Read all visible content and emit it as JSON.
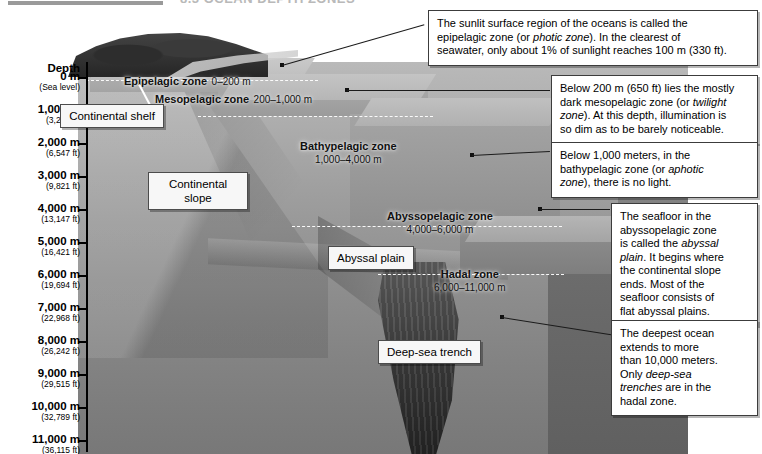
{
  "header": {
    "title": "8.3  OCEAN DEPTH ZONES"
  },
  "axis": {
    "title": "Depth",
    "ticks": [
      {
        "meters": "0 m",
        "feet": "(Sea level)"
      },
      {
        "meters": "1,000 m",
        "feet": "(3,274 ft)"
      },
      {
        "meters": "2,000 m",
        "feet": "(6,547 ft)"
      },
      {
        "meters": "3,000 m",
        "feet": "(9,821 ft)"
      },
      {
        "meters": "4,000 m",
        "feet": "(13,147 ft)"
      },
      {
        "meters": "5,000 m",
        "feet": "(16,421 ft)"
      },
      {
        "meters": "6,000 m",
        "feet": "(19,694 ft)"
      },
      {
        "meters": "7,000 m",
        "feet": "(22,968 ft)"
      },
      {
        "meters": "8,000 m",
        "feet": "(26,242 ft)"
      },
      {
        "meters": "9,000 m",
        "feet": "(29,515 ft)"
      },
      {
        "meters": "10,000 m",
        "feet": "(32,789 ft)"
      },
      {
        "meters": "11,000 m",
        "feet": "(36,115 ft)"
      }
    ]
  },
  "zones": [
    {
      "name": "Epipelagic zone",
      "range": "0–200 m"
    },
    {
      "name": "Mesopelagic zone",
      "range": "200–1,000 m"
    },
    {
      "name": "Bathypelagic zone",
      "range": "1,000–4,000 m"
    },
    {
      "name": "Abyssopelagic zone",
      "range": "4,000–6,000 m"
    },
    {
      "name": "Hadal zone",
      "range": "6,000–11,000 m"
    }
  ],
  "feature_labels": {
    "continental_shelf": "Continental shelf",
    "continental_slope": "Continental slope",
    "abyssal_plain": "Abyssal plain",
    "deep_sea_trench": "Deep-sea trench"
  },
  "notes": {
    "epipelagic": {
      "line1": "The sunlit surface region of the oceans is called the",
      "line2_a": "epipelagic zone (or ",
      "line2_em": "photic zone",
      "line2_b": "). In the clearest of",
      "line3": "seawater, only about 1% of sunlight reaches 100 m (330 ft)."
    },
    "mesopelagic": {
      "line1": "Below 200 m (650 ft) lies the mostly",
      "line2_a": "dark mesopelagic zone (or ",
      "line2_em": "twilight",
      "line3_em": "zone",
      "line3_b": "). At this depth, illumination is",
      "line4": "so dim as to be barely noticeable."
    },
    "bathypelagic": {
      "line1": "Below 1,000 meters, in the",
      "line2_a": "bathypelagic zone (or ",
      "line2_em": "aphotic",
      "line3_em": "zone",
      "line3_b": "), there is no light."
    },
    "abyssal": {
      "line1": "The seafloor in the",
      "line2": "abyssopelagic zone",
      "line3_a": "is called the ",
      "line3_em": "abyssal",
      "line4_em": "plain",
      "line4_b": ". It begins where",
      "line5": "the continental slope",
      "line6": "ends. Most of the",
      "line7": "seafloor consists of",
      "line8": "flat abyssal plains."
    },
    "hadal": {
      "line1": "The deepest ocean",
      "line2": "extends to more",
      "line3": "than 10,000 meters.",
      "line4_a": "Only ",
      "line4_em": "deep-sea",
      "line5_em": "trenches",
      "line5_b": " are in the",
      "line6": "hadal zone."
    }
  },
  "colors": {
    "note_border": "#3c3c3c",
    "chip_bg": "#f7f7f7",
    "axis": "#000000",
    "water_top": "#b9b9b9",
    "water_bottom": "#787878",
    "trench_dark": "#242424"
  }
}
